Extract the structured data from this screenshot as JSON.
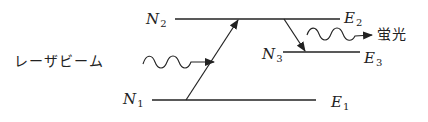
{
  "diagram": {
    "type": "energy-level-diagram",
    "levels": [
      {
        "name": "N2",
        "var": "N",
        "sub": "2",
        "energy_var": "E",
        "energy_sub": "2"
      },
      {
        "name": "N3",
        "var": "N",
        "sub": "3",
        "energy_var": "E",
        "energy_sub": "3"
      },
      {
        "name": "N1",
        "var": "N",
        "sub": "1",
        "energy_var": "E",
        "energy_sub": "1"
      }
    ],
    "laser_label": "レーザビーム",
    "fluorescence_label": "蛍光",
    "transitions": [
      {
        "from": "N1",
        "to": "N2",
        "kind": "excitation by laser"
      },
      {
        "from": "N2",
        "to": "N3",
        "kind": "relaxation"
      },
      {
        "from": "N3",
        "kind": "fluorescence emission"
      }
    ],
    "colors": {
      "line": "#222222"
    }
  }
}
